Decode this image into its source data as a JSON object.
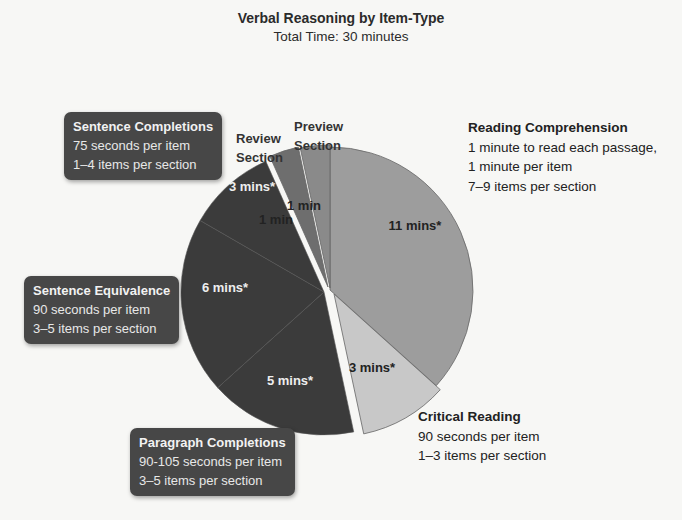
{
  "title": "Verbal Reasoning by Item-Type",
  "subtitle": "Total Time: 30 minutes",
  "chart_data": {
    "type": "pie",
    "title": "Verbal Reasoning by Item-Type",
    "subtitle": "Total Time: 30 minutes",
    "unit": "minutes",
    "start_angle_deg": 0,
    "direction": "clockwise",
    "legend_position": "callouts",
    "slices": [
      {
        "name": "Reading Comprehension",
        "value": 11,
        "label": "11 mins*",
        "color": "#9d9d9d",
        "details": [
          "1 minute to read each passage,",
          "1 minute per item",
          "7–9 items per section"
        ]
      },
      {
        "name": "Critical Reading",
        "value": 3,
        "label": "3 mins*",
        "color": "#c8c8c8",
        "details": [
          "90 seconds per item",
          "1–3 items per section"
        ]
      },
      {
        "name": "Paragraph Completions",
        "value": 5,
        "label": "5 mins*",
        "color": "#3b3b3b",
        "details": [
          "90-105 seconds per item",
          "3–5 items per section"
        ]
      },
      {
        "name": "Sentence Equivalence",
        "value": 6,
        "label": "6 mins*",
        "color": "#3b3b3b",
        "details": [
          "90 seconds per item",
          "3–5 items per section"
        ]
      },
      {
        "name": "Sentence Completions",
        "value": 3,
        "label": "3 mins*",
        "color": "#3b3b3b",
        "details": [
          "75 seconds per item",
          "1–4 items per section"
        ]
      },
      {
        "name": "Review Section",
        "value": 1,
        "label": "1 min",
        "color": "#6e6e6e",
        "details": []
      },
      {
        "name": "Preview Section",
        "value": 1,
        "label": "1 min",
        "color": "#8a8a8a",
        "details": []
      }
    ]
  },
  "callouts": {
    "sentence_completions": {
      "head": "Sentence Completions",
      "l1": "75 seconds per item",
      "l2": "1–4 items per section"
    },
    "sentence_equivalence": {
      "head": "Sentence Equivalence",
      "l1": "90 seconds per item",
      "l2": "3–5 items per section"
    },
    "paragraph_completions": {
      "head": "Paragraph Completions",
      "l1": "90-105 seconds per item",
      "l2": "3–5 items per section"
    },
    "reading_comprehension": {
      "head": "Reading Comprehension",
      "l1": "1 minute to read each passage,",
      "l2": "1 minute per item",
      "l3": "7–9 items per section"
    },
    "critical_reading": {
      "head": "Critical Reading",
      "l1": "90 seconds per item",
      "l2": "1–3 items per section"
    },
    "review": {
      "l1": "Review",
      "l2": "Section"
    },
    "preview": {
      "l1": "Preview",
      "l2": "Section"
    }
  },
  "slice_labels": {
    "rc": "11 mins*",
    "cr": "3 mins*",
    "pc": "5 mins*",
    "se": "6 mins*",
    "sc": "3 mins*",
    "review": "1 min",
    "preview": "1 min"
  }
}
